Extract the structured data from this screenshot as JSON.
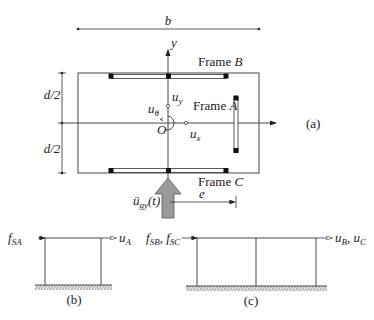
{
  "plan": {
    "dim_b": "b",
    "dim_d_top": "d/2",
    "dim_d_bottom": "d/2",
    "axis_y": "y",
    "origin": "O",
    "frame_a_word": "Frame ",
    "frame_a_letter": "A",
    "frame_b_word": "Frame ",
    "frame_b_letter": "B",
    "frame_c_word": "Frame ",
    "frame_c_letter": "C",
    "u_y": "u",
    "u_y_sub": "y",
    "u_theta": "u",
    "u_theta_sub": "θ",
    "u_x": "u",
    "u_x_sub": "x",
    "ground_accel": "ü",
    "ground_accel_sub": "gy",
    "ground_accel_arg": "(t)",
    "dim_e": "e",
    "panel_label": "(a)"
  },
  "frame_b_panel": {
    "force": "f",
    "force_sub": "SA",
    "disp": "u",
    "disp_sub": "A",
    "panel_label": "(b)"
  },
  "frame_c_panel": {
    "force1": "f",
    "force1_sub": "SB",
    "sep": ", ",
    "force2": "f",
    "force2_sub": "SC",
    "disp1": "u",
    "disp1_sub": "B",
    "disp2": "u",
    "disp2_sub": "C",
    "panel_label": "(c)"
  },
  "colors": {
    "line": "#333333",
    "arrow_fill": "#9a9a9a",
    "column_marker": "#111111"
  }
}
